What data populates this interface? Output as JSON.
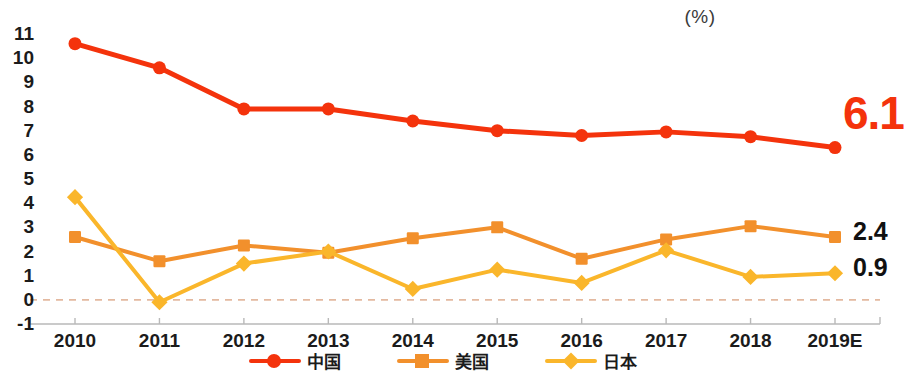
{
  "chart_data": {
    "type": "line",
    "title": "",
    "subtitle": "",
    "unit_label": "(%)",
    "xlabel": "",
    "ylabel": "",
    "categories": [
      "2010",
      "2011",
      "2012",
      "2013",
      "2014",
      "2015",
      "2016",
      "2017",
      "2018",
      "2019E"
    ],
    "ylim": [
      -1,
      11
    ],
    "yticks": [
      11,
      10,
      9,
      8,
      7,
      6,
      5,
      4,
      3,
      2,
      1,
      0,
      -1
    ],
    "grid": false,
    "zero_line": true,
    "legend_position": "bottom",
    "series": [
      {
        "name": "中国",
        "color": "#f4330c",
        "marker": "circle",
        "values": [
          10.6,
          9.6,
          7.9,
          7.9,
          7.4,
          7.0,
          6.8,
          6.95,
          6.75,
          6.3
        ],
        "end_label": "6.1"
      },
      {
        "name": "美国",
        "color": "#f2902c",
        "marker": "square",
        "values": [
          2.6,
          1.6,
          2.25,
          1.95,
          2.55,
          3.0,
          1.7,
          2.5,
          3.05,
          2.6
        ],
        "end_label": "2.4"
      },
      {
        "name": "日本",
        "color": "#fab62b",
        "marker": "diamond",
        "values": [
          4.25,
          -0.1,
          1.5,
          2.0,
          0.45,
          1.25,
          0.7,
          2.05,
          0.95,
          1.1
        ],
        "end_label": "0.9"
      }
    ],
    "end_labels": [
      {
        "text": "6.1",
        "series": "中国",
        "color": "#f4330c",
        "size": "big"
      },
      {
        "text": "2.4",
        "series": "美国",
        "color": "#111111",
        "size": "small"
      },
      {
        "text": "0.9",
        "series": "日本",
        "color": "#111111",
        "size": "small"
      }
    ],
    "axis_color": "#b9b9b9",
    "zero_line_color": "#e3b9a0"
  }
}
